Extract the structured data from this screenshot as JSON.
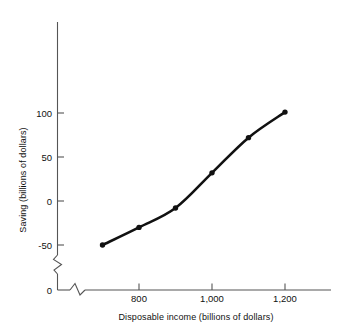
{
  "chart_data": {
    "type": "line",
    "title": "",
    "subtitle": "",
    "xlabel": "Disposable income (billions of dollars)",
    "ylabel": "Saving (billions of dollars)",
    "x": [
      700,
      800,
      900,
      1000,
      1100,
      1200
    ],
    "values": [
      -50,
      -30,
      -8,
      32,
      72,
      101
    ],
    "series": [
      {
        "name": "Saving",
        "x": [
          700,
          800,
          900,
          1000,
          1100,
          1200
        ],
        "values": [
          -50,
          -30,
          -8,
          32,
          72,
          101
        ]
      }
    ],
    "xticks": [
      800,
      1000,
      1200
    ],
    "xtick_labels": [
      "800",
      "1,000",
      "1,200"
    ],
    "yticks": [
      -50,
      0,
      50,
      100
    ],
    "ytick_labels": [
      "-50",
      "0",
      "50",
      "100"
    ],
    "xlim": [
      660,
      1240
    ],
    "ylim": [
      -62,
      118
    ],
    "grid": false,
    "legend": null,
    "legend_position": "none",
    "axis_break_x": true,
    "axis_break_y": true,
    "origin_label": "0",
    "markers": true,
    "marker_shape": "circle",
    "line_color": "#111111",
    "marker_color": "#111111",
    "axis_color": "#555555",
    "background_color": "#ffffff",
    "annotations": []
  },
  "axes": {
    "y_axis_title": "Saving (billions of dollars)",
    "x_axis_title": "Disposable income (billions of dollars)",
    "origin_tick_label": "0"
  },
  "y_ticks": [
    {
      "label": "100",
      "value": 100
    },
    {
      "label": "50",
      "value": 50
    },
    {
      "label": "0",
      "value": 0
    },
    {
      "label": "-50",
      "value": -50
    }
  ],
  "x_ticks": [
    {
      "label": "800",
      "value": 800
    },
    {
      "label": "1,000",
      "value": 1000
    },
    {
      "label": "1,200",
      "value": 1200
    }
  ],
  "points": [
    {
      "x": 700,
      "y": -50
    },
    {
      "x": 800,
      "y": -30
    },
    {
      "x": 900,
      "y": -8
    },
    {
      "x": 1000,
      "y": 32
    },
    {
      "x": 1100,
      "y": 72
    },
    {
      "x": 1200,
      "y": 101
    }
  ],
  "colors": {
    "line": "#111111",
    "axis": "#555555",
    "text": "#111111",
    "background": "#ffffff"
  }
}
